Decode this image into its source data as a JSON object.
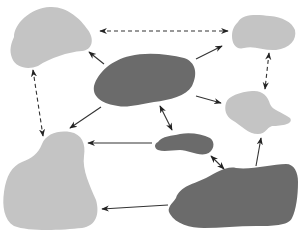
{
  "diagram": {
    "type": "blob-network",
    "colors": {
      "background": "#ffffff",
      "dark_node": "#6b6b6b",
      "light_node": "#c4c4c4",
      "edge": "#333333"
    },
    "nodes": [
      {
        "id": "top-left",
        "shade": "light"
      },
      {
        "id": "top-right",
        "shade": "light"
      },
      {
        "id": "center",
        "shade": "dark"
      },
      {
        "id": "right-middle",
        "shade": "light"
      },
      {
        "id": "small-middle",
        "shade": "dark"
      },
      {
        "id": "bottom-left",
        "shade": "light"
      },
      {
        "id": "bottom-right",
        "shade": "dark"
      }
    ],
    "edges": [
      {
        "from": "top-left",
        "to": "top-right",
        "style": "dashed",
        "direction": "both"
      },
      {
        "from": "top-left",
        "to": "bottom-left",
        "style": "dashed",
        "direction": "both"
      },
      {
        "from": "top-right",
        "to": "right-middle",
        "style": "dashed",
        "direction": "both"
      },
      {
        "from": "center",
        "to": "top-left",
        "style": "solid",
        "direction": "forward"
      },
      {
        "from": "center",
        "to": "top-right",
        "style": "solid",
        "direction": "forward"
      },
      {
        "from": "center",
        "to": "right-middle",
        "style": "solid",
        "direction": "forward"
      },
      {
        "from": "center",
        "to": "bottom-left",
        "style": "solid",
        "direction": "forward"
      },
      {
        "from": "center",
        "to": "small-middle",
        "style": "solid",
        "direction": "both"
      },
      {
        "from": "small-middle",
        "to": "bottom-left",
        "style": "solid",
        "direction": "forward"
      },
      {
        "from": "small-middle",
        "to": "bottom-right",
        "style": "solid",
        "direction": "both"
      },
      {
        "from": "bottom-right",
        "to": "right-middle",
        "style": "solid",
        "direction": "forward"
      },
      {
        "from": "bottom-right",
        "to": "bottom-left",
        "style": "solid",
        "direction": "forward"
      }
    ]
  }
}
